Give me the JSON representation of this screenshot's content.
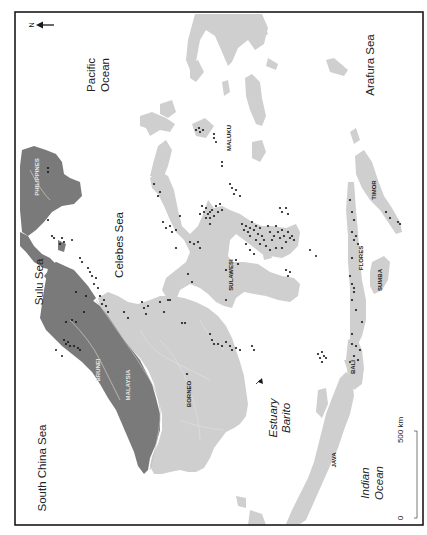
{
  "map": {
    "orientation_note": "north arrow points left",
    "north": {
      "label": "N",
      "icon": "north-arrow-icon"
    },
    "seas": [
      {
        "id": "pacific-ocean",
        "lines": [
          "Pacific",
          "Ocean"
        ]
      },
      {
        "id": "arafura-sea",
        "lines": [
          "Arafura Sea"
        ]
      },
      {
        "id": "sulu-sea",
        "lines": [
          "Sulu Sea"
        ]
      },
      {
        "id": "celebes-sea",
        "lines": [
          "Celebes Sea"
        ]
      },
      {
        "id": "south-china-sea",
        "lines": [
          "South China Sea"
        ]
      },
      {
        "id": "indian-ocean",
        "lines": [
          "Indian",
          "Ocean"
        ]
      }
    ],
    "annotations": [
      {
        "id": "estuary-barito",
        "lines": [
          "Estuary",
          "Barito"
        ]
      }
    ],
    "regions": [
      {
        "id": "philippines",
        "label": "PHILIPPINES"
      },
      {
        "id": "maluku",
        "label": "MALUKU"
      },
      {
        "id": "sulawesi",
        "label": "SULAWESI"
      },
      {
        "id": "timor",
        "label": "TIMOR"
      },
      {
        "id": "flores",
        "label": "FLORES"
      },
      {
        "id": "sumba",
        "label": "SUMBA"
      },
      {
        "id": "brunei",
        "label": "BRUNEI"
      },
      {
        "id": "malaysia",
        "label": "MALAYSIA"
      },
      {
        "id": "borneo",
        "label": "BORNEO"
      },
      {
        "id": "bali",
        "label": "BALI"
      },
      {
        "id": "java",
        "label": "JAVA"
      }
    ],
    "scale_bar": {
      "start": "0",
      "end": "500 km"
    },
    "colors": {
      "land_light": "#cfcfcf",
      "land_dark": "#7a7a7a",
      "sites": "#1a1a1a",
      "frame": "#1a1a1a",
      "sea": "#ffffff"
    }
  }
}
